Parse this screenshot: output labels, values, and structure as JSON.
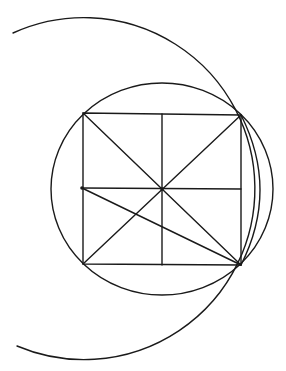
{
  "diagram": {
    "type": "geometric-construction",
    "background": "#ffffff",
    "stroke_color": "#1a1a1a",
    "stroke_width": 1.4,
    "square": {
      "top_left": [
        83,
        113
      ],
      "top_right": [
        241,
        115
      ],
      "bottom_right": [
        241,
        265
      ],
      "bottom_left": [
        83,
        264
      ]
    },
    "center": [
      162,
      189
    ],
    "midlines": {
      "vertical": [
        [
          162,
          114
        ],
        [
          162,
          265
        ]
      ],
      "horizontal": [
        [
          82,
          188
        ],
        [
          241,
          189
        ]
      ]
    },
    "diagonals": [
      [
        [
          83,
          113
        ],
        [
          241,
          265
        ]
      ],
      [
        [
          241,
          115
        ],
        [
          83,
          264
        ]
      ]
    ],
    "extra_line": [
      [
        82,
        188
      ],
      [
        241,
        265
      ]
    ],
    "points": [
      {
        "name": "left-midpoint",
        "xy": [
          82,
          188
        ]
      },
      {
        "name": "center",
        "xy": [
          162,
          189
        ]
      }
    ],
    "circumscribed_circle": {
      "center": [
        162,
        189
      ],
      "rx": 111,
      "ry": 106
    },
    "large_arc": {
      "center": [
        82,
        188
      ],
      "radius": 171,
      "start": [
        13,
        33
      ],
      "end": [
        17,
        346
      ]
    },
    "right_arc": {
      "start": [
        241,
        115
      ],
      "end": [
        241,
        265
      ],
      "max_x": 260
    }
  }
}
